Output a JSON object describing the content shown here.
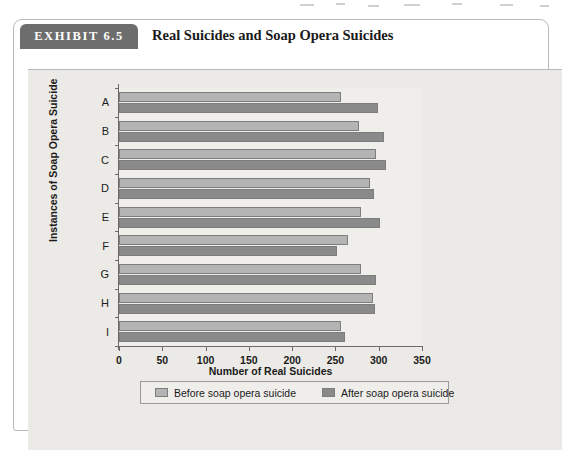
{
  "exhibit": {
    "tab_label": "EXHIBIT 6.5",
    "title": "Real Suicides and Soap Opera Suicides"
  },
  "chart_data": {
    "type": "bar",
    "orientation": "horizontal",
    "title": "Real Suicides and Soap Opera Suicides",
    "xlabel": "Number of Real Suicides",
    "ylabel": "Instances of Soap Opera Suicide",
    "categories": [
      "A",
      "B",
      "C",
      "D",
      "E",
      "F",
      "G",
      "H",
      "I"
    ],
    "xlim": [
      0,
      350
    ],
    "xticks": [
      0,
      50,
      100,
      150,
      200,
      250,
      300,
      350
    ],
    "xtick_labels": [
      "0",
      "50",
      "100",
      "150",
      "200",
      "250",
      "300",
      "350"
    ],
    "grid": false,
    "legend_position": "bottom",
    "series": [
      {
        "name": "Before soap opera suicide",
        "color": "#b4b4b4",
        "values": [
          257,
          277,
          297,
          290,
          279,
          264,
          280,
          293,
          257
        ]
      },
      {
        "name": "After soap opera suicide",
        "color": "#8a8a8a",
        "values": [
          299,
          306,
          308,
          295,
          301,
          252,
          297,
          296,
          261
        ]
      }
    ]
  },
  "legend": {
    "before_label": "Before soap opera suicide",
    "after_label": "After soap opera suicide"
  }
}
